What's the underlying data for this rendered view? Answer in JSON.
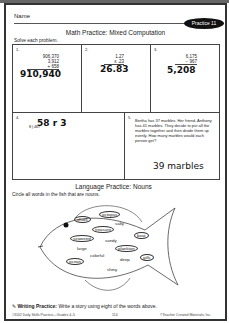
{
  "header": {
    "name_label": "Name",
    "badge": "Practice 11"
  },
  "math": {
    "title": "Math Practice:  Mixed Computation",
    "instruction": "Solve each problem.",
    "problems": [
      {
        "number": "1.",
        "lines": [
          "906,370",
          "3,912",
          "+ 658"
        ],
        "answer": "910,940"
      },
      {
        "number": "2.",
        "lines": [
          "1.27",
          "x .23"
        ],
        "answer": "26.83"
      },
      {
        "number": "3.",
        "lines": [
          "6,175",
          "− 967"
        ],
        "answer": "5,208"
      },
      {
        "number": "4.",
        "lines": [
          "8 ) 467"
        ],
        "answer": "58 r 3"
      },
      {
        "number": "5.",
        "text": "Bertha has 37 marbles.  Her friend, Anthony has 41 marbles.  They decide to put all the marbles together and then divide them up evenly.  How many marbles would each person get?",
        "answer": "39 marbles"
      }
    ]
  },
  "language": {
    "title": "Language Practice:  Nouns",
    "instruction": "Circle all words in the fish that are nouns.",
    "words": [
      {
        "text": "shark",
        "circled": true
      },
      {
        "text": "octopus",
        "circled": true
      },
      {
        "text": "salty",
        "circled": false
      },
      {
        "text": "treasure",
        "circled": true
      },
      {
        "text": "seaweed",
        "circled": true
      },
      {
        "text": "sandy",
        "circled": false
      },
      {
        "text": "boat",
        "circled": true
      },
      {
        "text": "large",
        "circled": false
      },
      {
        "text": "plankton",
        "circled": true
      },
      {
        "text": "colorful",
        "circled": false
      },
      {
        "text": "deep",
        "circled": false
      },
      {
        "text": "gills",
        "circled": true
      },
      {
        "text": "ocean",
        "circled": true
      },
      {
        "text": "shiny",
        "circled": false
      }
    ]
  },
  "writing": {
    "label": "Writing Practice:",
    "text": "Write a story using eight of the words above."
  },
  "footer": {
    "left": "#3102 Daily Skills Practice—Grades 4–5",
    "center": "114",
    "right": "©Teacher Created Materials, Inc."
  }
}
